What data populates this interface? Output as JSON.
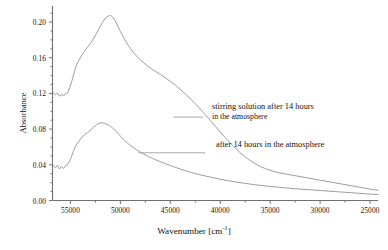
{
  "chart_data": {
    "type": "line",
    "title": "",
    "xlabel": "Wavenumber [cm-1]",
    "ylabel": "Absorbance",
    "xlim": [
      56800,
      24200
    ],
    "ylim": [
      0.0,
      0.218
    ],
    "x_reversed": true,
    "grid": false,
    "legend_position": "inline-annotations",
    "xticks": [
      55000,
      50000,
      45000,
      40000,
      35000,
      30000,
      25000
    ],
    "xtick_labels": [
      "55000",
      "50000",
      "45000",
      "40000",
      "35000",
      "30000",
      "25000"
    ],
    "x_minor_tick_step": 2500,
    "yticks": [
      0.0,
      0.04,
      0.08,
      0.12,
      0.16,
      0.2
    ],
    "ytick_labels": [
      "0.00",
      "0.04",
      "0.08",
      "0.12",
      "0.16",
      "0.20"
    ],
    "y_minor_tick_step": 0.01,
    "series": [
      {
        "name": "stirring solution after 14 hours in the atmosphere",
        "color": "#8a8a8a",
        "x": [
          56800,
          56500,
          56300,
          56100,
          55900,
          55700,
          55500,
          55300,
          55100,
          54900,
          54700,
          54500,
          54200,
          53900,
          53600,
          53300,
          53000,
          52700,
          52400,
          52100,
          51800,
          51500,
          51200,
          51000,
          50800,
          50600,
          50400,
          50200,
          50000,
          49700,
          49400,
          49000,
          48600,
          48200,
          47800,
          47400,
          47000,
          46500,
          46000,
          45500,
          45000,
          44500,
          44000,
          43500,
          43000,
          42500,
          42000,
          41500,
          41000,
          40500,
          40000,
          39500,
          39000,
          38500,
          38000,
          37500,
          37000,
          36500,
          36000,
          35500,
          35000,
          34500,
          34000,
          33500,
          33000,
          32500,
          32000,
          31500,
          31000,
          30500,
          30000,
          29500,
          29000,
          28500,
          28000,
          27500,
          27000,
          26500,
          26000,
          25500,
          25000,
          24500,
          24200
        ],
        "y": [
          0.1215,
          0.1185,
          0.1205,
          0.1168,
          0.1192,
          0.1172,
          0.1198,
          0.1205,
          0.1255,
          0.1325,
          0.1405,
          0.1488,
          0.1562,
          0.1622,
          0.1672,
          0.1718,
          0.1762,
          0.1812,
          0.1872,
          0.1935,
          0.1995,
          0.2042,
          0.2068,
          0.2072,
          0.2058,
          0.2028,
          0.1988,
          0.1942,
          0.1895,
          0.1832,
          0.1772,
          0.1705,
          0.1648,
          0.1598,
          0.1555,
          0.1518,
          0.1485,
          0.1448,
          0.1412,
          0.1375,
          0.1335,
          0.1292,
          0.1245,
          0.1195,
          0.1142,
          0.1085,
          0.1025,
          0.0962,
          0.0898,
          0.0832,
          0.0768,
          0.0705,
          0.0645,
          0.0588,
          0.0535,
          0.0488,
          0.0448,
          0.0412,
          0.0382,
          0.0358,
          0.0338,
          0.0322,
          0.0308,
          0.0298,
          0.0288,
          0.0278,
          0.0268,
          0.0258,
          0.0248,
          0.0238,
          0.0228,
          0.0218,
          0.0208,
          0.0198,
          0.0188,
          0.0178,
          0.0168,
          0.0158,
          0.0148,
          0.0138,
          0.0128,
          0.012,
          0.0115
        ]
      },
      {
        "name": "after 14 hours in the atmosphere",
        "color": "#8a8a8a",
        "x": [
          56800,
          56500,
          56300,
          56100,
          55900,
          55700,
          55500,
          55300,
          55100,
          54900,
          54700,
          54500,
          54200,
          53900,
          53600,
          53300,
          53000,
          52700,
          52400,
          52100,
          51800,
          51500,
          51200,
          51000,
          50800,
          50600,
          50400,
          50200,
          50000,
          49700,
          49400,
          49000,
          48600,
          48200,
          47800,
          47400,
          47000,
          46500,
          46000,
          45500,
          45000,
          44500,
          44000,
          43500,
          43000,
          42500,
          42000,
          41500,
          41000,
          40500,
          40000,
          39500,
          39000,
          38500,
          38000,
          37500,
          37000,
          36500,
          36000,
          35500,
          35000,
          34500,
          34000,
          33500,
          33000,
          32500,
          32000,
          31500,
          31000,
          30500,
          30000,
          29500,
          29000,
          28500,
          28000,
          27500,
          27000,
          26500,
          26000,
          25500,
          25000,
          24500,
          24200
        ],
        "y": [
          0.0398,
          0.0368,
          0.0392,
          0.0352,
          0.0382,
          0.0358,
          0.0388,
          0.0402,
          0.0438,
          0.0492,
          0.0552,
          0.0608,
          0.0658,
          0.07,
          0.0735,
          0.0762,
          0.0788,
          0.0818,
          0.0848,
          0.0868,
          0.0872,
          0.0862,
          0.0845,
          0.0832,
          0.0815,
          0.0795,
          0.0772,
          0.0748,
          0.0722,
          0.0688,
          0.0655,
          0.0618,
          0.0585,
          0.0555,
          0.0528,
          0.0505,
          0.0482,
          0.0458,
          0.0435,
          0.0412,
          0.0392,
          0.0372,
          0.0352,
          0.0335,
          0.0318,
          0.0302,
          0.0288,
          0.0275,
          0.0262,
          0.025,
          0.0238,
          0.0228,
          0.0218,
          0.0208,
          0.02,
          0.0192,
          0.0184,
          0.0177,
          0.017,
          0.0164,
          0.0158,
          0.0152,
          0.0147,
          0.0142,
          0.0137,
          0.0132,
          0.0128,
          0.0124,
          0.012,
          0.0116,
          0.0112,
          0.0108,
          0.0104,
          0.01,
          0.0096,
          0.0092,
          0.0088,
          0.0084,
          0.008,
          0.0076,
          0.0072,
          0.0068,
          0.0066
        ]
      }
    ],
    "annotations": [
      {
        "id": "upper",
        "line1": "stirring solution after 14 hours",
        "line2": "in the atmosphere",
        "leader_from_x": 44700,
        "leader_to_x": 41700,
        "leader_y": 0.0935
      },
      {
        "id": "lower",
        "line1": "after 14 hours in the atmosphere",
        "line2": "",
        "leader_from_x": 48200,
        "leader_to_x": 41500,
        "leader_y": 0.0535
      }
    ]
  },
  "axis": {
    "ylabel": "Absorbance",
    "xlabel_main": "Wavenumber [cm",
    "xlabel_sup": "-1",
    "xlabel_tail": "]"
  }
}
